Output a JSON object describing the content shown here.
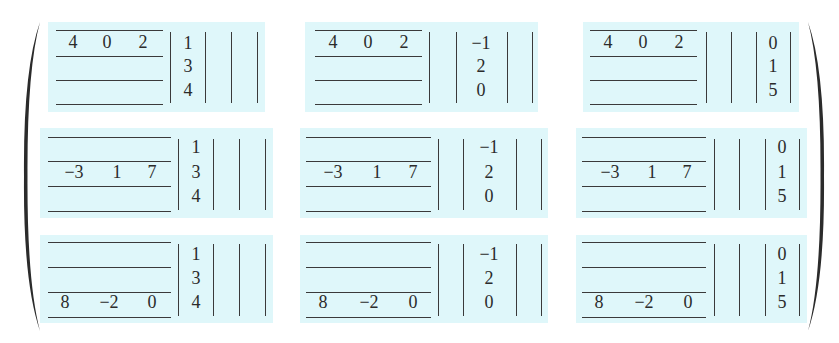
{
  "matrix_A_rows": [
    [
      "4",
      "0",
      "2"
    ],
    [
      "−3",
      "1",
      "7"
    ],
    [
      "8",
      "−2",
      "0"
    ]
  ],
  "matrix_B_columns": [
    [
      "1",
      "3",
      "4"
    ],
    [
      "−1",
      "2",
      "0"
    ],
    [
      "0",
      "1",
      "5"
    ]
  ],
  "cells": [
    {
      "row_index": 0,
      "col_index": 0,
      "row_values": [
        "4",
        "0",
        "2"
      ],
      "col_values": [
        "1",
        "3",
        "4"
      ]
    },
    {
      "row_index": 0,
      "col_index": 1,
      "row_values": [
        "4",
        "0",
        "2"
      ],
      "col_values": [
        "−1",
        "2",
        "0"
      ]
    },
    {
      "row_index": 0,
      "col_index": 2,
      "row_values": [
        "4",
        "0",
        "2"
      ],
      "col_values": [
        "0",
        "1",
        "5"
      ]
    },
    {
      "row_index": 1,
      "col_index": 0,
      "row_values": [
        "−3",
        "1",
        "7"
      ],
      "col_values": [
        "1",
        "3",
        "4"
      ]
    },
    {
      "row_index": 1,
      "col_index": 1,
      "row_values": [
        "−3",
        "1",
        "7"
      ],
      "col_values": [
        "−1",
        "2",
        "0"
      ]
    },
    {
      "row_index": 1,
      "col_index": 2,
      "row_values": [
        "−3",
        "1",
        "7"
      ],
      "col_values": [
        "0",
        "1",
        "5"
      ]
    },
    {
      "row_index": 2,
      "col_index": 0,
      "row_values": [
        "8",
        "−2",
        "0"
      ],
      "col_values": [
        "1",
        "3",
        "4"
      ]
    },
    {
      "row_index": 2,
      "col_index": 1,
      "row_values": [
        "8",
        "−2",
        "0"
      ],
      "col_values": [
        "−1",
        "2",
        "0"
      ]
    },
    {
      "row_index": 2,
      "col_index": 2,
      "row_values": [
        "8",
        "−2",
        "0"
      ],
      "col_values": [
        "0",
        "1",
        "5"
      ]
    }
  ],
  "colors": {
    "cell_background": "#dff7fa",
    "rule": "#3a3a3a",
    "text": "#2b2b2b",
    "page_background": "#ffffff"
  }
}
